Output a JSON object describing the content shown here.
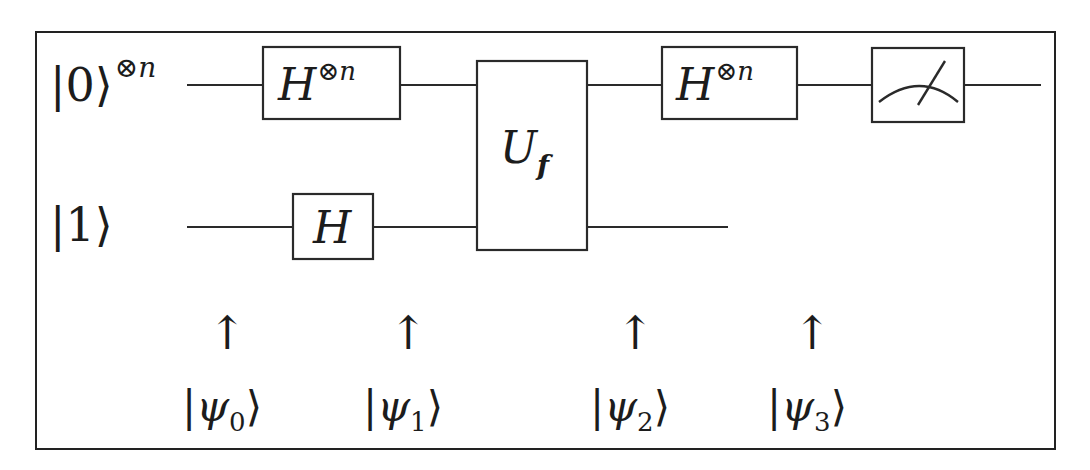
{
  "diagram": {
    "type": "quantum-circuit",
    "algorithm_layout": "oracle circuit with two registers",
    "registers": [
      {
        "id": "top",
        "ket": "0",
        "ket_superscript": "⊗n",
        "wire_y": 85
      },
      {
        "id": "bottom",
        "ket": "1",
        "ket_superscript": "",
        "wire_y": 227
      }
    ],
    "gates": [
      {
        "id": "hadamard-n-1",
        "register": "top",
        "label": "H",
        "superscript": "⊗n"
      },
      {
        "id": "hadamard-1",
        "register": "bottom",
        "label": "H",
        "superscript": ""
      },
      {
        "id": "oracle",
        "register": "both",
        "label": "U",
        "subscript": "f"
      },
      {
        "id": "hadamard-n-2",
        "register": "top",
        "label": "H",
        "superscript": "⊗n"
      },
      {
        "id": "measurement",
        "register": "top",
        "label": "",
        "icon": "meter-icon"
      }
    ],
    "state_markers": [
      {
        "arrow": "↑",
        "psi": "ψ",
        "index": "0"
      },
      {
        "arrow": "↑",
        "psi": "ψ",
        "index": "1"
      },
      {
        "arrow": "↑",
        "psi": "ψ",
        "index": "2"
      },
      {
        "arrow": "↑",
        "psi": "ψ",
        "index": "3"
      }
    ],
    "ket_open": "|",
    "ket_close": "⟩",
    "colors": {
      "ink": "#1c1c1c",
      "background": "#ffffff"
    }
  }
}
